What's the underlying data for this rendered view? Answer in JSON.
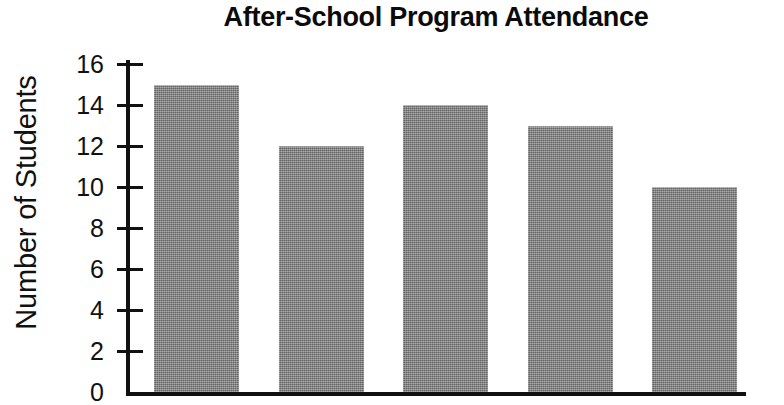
{
  "chart_data": {
    "type": "bar",
    "title": "After-School Program Attendance",
    "xlabel": "",
    "ylabel": "Number of Students",
    "categories": [
      "",
      "",
      "",
      "",
      ""
    ],
    "values": [
      15,
      12,
      14,
      13,
      10
    ],
    "ytick_labels": [
      "16",
      "14",
      "12",
      "10",
      "8",
      "6",
      "4",
      "2",
      "0"
    ],
    "yticks": [
      16,
      14,
      12,
      10,
      8,
      6,
      4,
      2,
      0
    ],
    "ylim": [
      0,
      16.5
    ],
    "grid": false,
    "legend": false,
    "legend_position": "none",
    "bar_color": "#808080",
    "axis_color": "#111111",
    "text_color": "#111111",
    "background_color": "#ffffff"
  }
}
